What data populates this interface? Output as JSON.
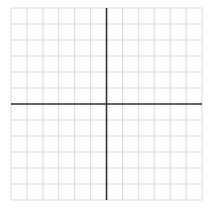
{
  "diagram": {
    "type": "coordinate-grid",
    "columns": 12,
    "rows": 12,
    "origin_col": 6,
    "origin_row": 6,
    "grid": {
      "left": 11,
      "top": 8,
      "cell_w": 15.92,
      "cell_h": 16,
      "line_color": "#d9d9d9",
      "line_width": 1
    },
    "axes": {
      "color": "#333333",
      "width": 1.6
    },
    "background": "#ffffff"
  }
}
